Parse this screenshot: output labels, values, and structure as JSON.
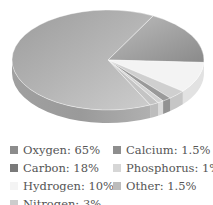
{
  "chart_data": {
    "type": "pie",
    "style": "3d",
    "title": "",
    "categories": [
      "Oxygen",
      "Carbon",
      "Hydrogen",
      "Nitrogen",
      "Calcium",
      "Phosphorus",
      "Other"
    ],
    "values": [
      65,
      18,
      10,
      3,
      1.5,
      1,
      1.5
    ],
    "unit": "%",
    "colors": [
      "#a9a9a9",
      "#8f8f8f",
      "#f3f3f3",
      "#cfcfcf",
      "#9a9a9a",
      "#d3d3d3",
      "#c4c4c4"
    ],
    "legend_position": "bottom",
    "legend": [
      {
        "label": "Oxygen: 65%",
        "color": "#8c8c8c"
      },
      {
        "label": "Carbon: 18%",
        "color": "#7a7a7a"
      },
      {
        "label": "Hydrogen: 10%",
        "color": "#f4f4f4"
      },
      {
        "label": "Nitrogen: 3%",
        "color": "#cccccc"
      },
      {
        "label": "Calcium: 1.5%",
        "color": "#8e8e8e"
      },
      {
        "label": "Phosphorus: 1%",
        "color": "#d6d6d6"
      },
      {
        "label": "Other: 1.5%",
        "color": "#bcbcbc"
      }
    ]
  }
}
